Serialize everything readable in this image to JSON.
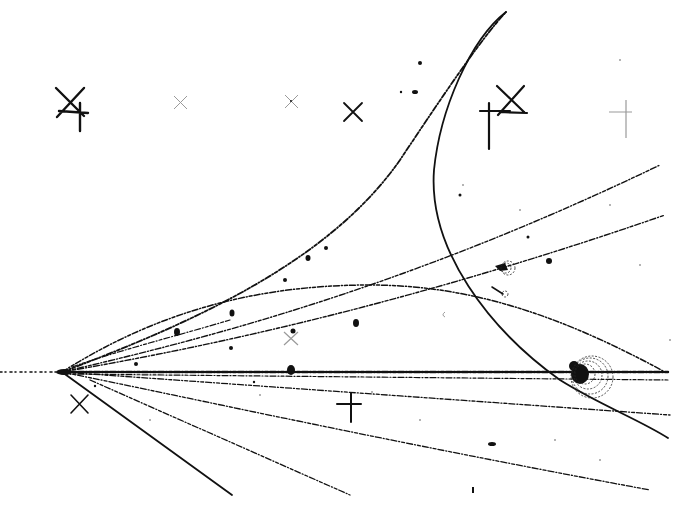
{
  "image": {
    "subject": "bubble chamber photograph of particle tracks",
    "background_color": "#ffffff",
    "ink_color": "#111111"
  },
  "vertex": {
    "x": 62,
    "y": 372
  },
  "fiducial_marks": [
    {
      "type": "x-with-cross",
      "x": 70,
      "y": 102
    },
    {
      "type": "x-faint",
      "x": 180,
      "y": 102
    },
    {
      "type": "x-faint",
      "x": 291,
      "y": 102
    },
    {
      "type": "x",
      "x": 353,
      "y": 112
    },
    {
      "type": "cross",
      "x": 489,
      "y": 113
    },
    {
      "type": "x",
      "x": 512,
      "y": 97
    },
    {
      "type": "cross-faint",
      "x": 625,
      "y": 112
    },
    {
      "type": "x",
      "x": 79,
      "y": 404
    },
    {
      "type": "cross",
      "x": 351,
      "y": 404
    },
    {
      "type": "x-faint",
      "x": 291,
      "y": 338
    }
  ],
  "features": {
    "spiral_region": {
      "x": 587,
      "y": 372
    },
    "small_spiral": {
      "x": 505,
      "y": 268
    },
    "loop_top": {
      "x": 505,
      "y": 12
    }
  }
}
